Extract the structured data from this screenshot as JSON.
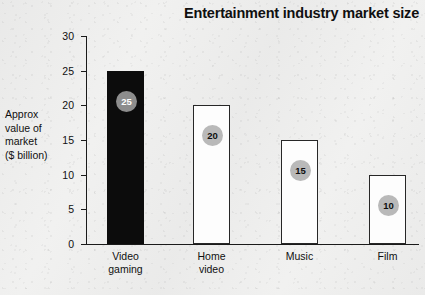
{
  "chart_data": {
    "type": "bar",
    "title": "Entertainment industry market size",
    "categories": [
      "Video gaming",
      "Home video",
      "Music",
      "Film"
    ],
    "values": [
      25,
      20,
      15,
      10
    ],
    "data_labels": [
      "25",
      "20",
      "15",
      "10"
    ],
    "xlabel": "",
    "ylabel": "Approx value of market ($ billion)",
    "ylabel_lines": [
      "Approx",
      "value of",
      "market",
      "($ billion)"
    ],
    "ylim": [
      0,
      30
    ],
    "ytick_labels": [
      "0",
      "5",
      "10",
      "15",
      "20",
      "25",
      "30"
    ],
    "ytick_values": [
      0,
      5,
      10,
      15,
      20,
      25,
      30
    ],
    "grid": false,
    "legend": false,
    "bar_styles": [
      "filled-black",
      "hollow-white",
      "hollow-white",
      "hollow-white"
    ],
    "colors": {
      "bar_filled": "#0c0c0c",
      "bar_hollow_fill": "#fdfdfd",
      "bar_outline": "#272727",
      "badge_on_dark": "#8d8d8d",
      "badge_on_light": "#b9b9b9",
      "axis": "#1a1a1a",
      "text": "#101010",
      "background": "#f1f1f0"
    }
  },
  "source_note": ""
}
